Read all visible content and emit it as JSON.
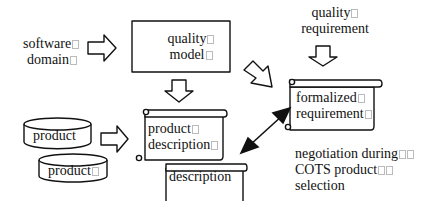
{
  "diagram": {
    "nodes": {
      "software_domain": {
        "line1": "software",
        "line2": "domain"
      },
      "quality_model": {
        "line1": "quality",
        "line2": "model"
      },
      "quality_requirement": {
        "line1": "quality",
        "line2": "requirement"
      },
      "product_db_1": {
        "label": "product"
      },
      "product_db_2": {
        "label": "product"
      },
      "product_description": {
        "line1": "product",
        "line2": "description"
      },
      "description": {
        "label": "description"
      },
      "formalized_requirement": {
        "line1": "formalized",
        "line2": "requirement"
      },
      "negotiation_note": {
        "line1": "negotiation during",
        "line2": "COTS product",
        "line3": "selection"
      }
    },
    "edges": [
      {
        "from": "software_domain",
        "to": "quality_model",
        "style": "block-arrow"
      },
      {
        "from": "quality_model",
        "to": "product_description",
        "style": "block-arrow"
      },
      {
        "from": "quality_model",
        "to": "formalized_requirement",
        "style": "block-arrow"
      },
      {
        "from": "quality_requirement",
        "to": "formalized_requirement",
        "style": "block-arrow"
      },
      {
        "from": "product_db_1",
        "to": "product_description",
        "style": "block-arrow"
      },
      {
        "from": "product_description",
        "to": "formalized_requirement",
        "style": "double-headed-arrow"
      }
    ]
  }
}
